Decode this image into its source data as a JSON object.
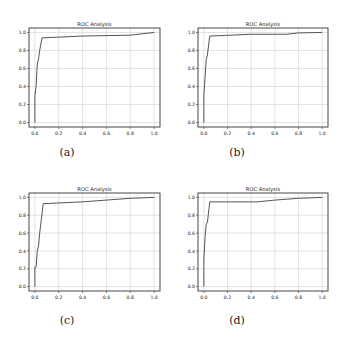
{
  "figure": {
    "captions": [
      "(a)",
      "(b)",
      "(c)",
      "(d)"
    ]
  },
  "chart_data": [
    {
      "type": "line",
      "panel": "a",
      "title": "ROC Analysis",
      "xlabel": "",
      "ylabel": "",
      "xlim": [
        0.0,
        1.0
      ],
      "ylim": [
        0.0,
        1.0
      ],
      "xticks": [
        "0.0",
        "0.2",
        "0.4",
        "0.6",
        "0.8",
        "1.0"
      ],
      "yticks": [
        "0.0",
        "0.2",
        "0.4",
        "0.6",
        "0.8",
        "1.0"
      ],
      "grid": true,
      "series": [
        {
          "name": "ROC",
          "x": [
            0.0,
            0.0,
            0.01,
            0.02,
            0.03,
            0.04,
            0.06,
            0.4,
            0.8,
            1.0
          ],
          "y": [
            0.0,
            0.3,
            0.4,
            0.65,
            0.7,
            0.8,
            0.94,
            0.96,
            0.97,
            1.0
          ]
        }
      ]
    },
    {
      "type": "line",
      "panel": "b",
      "title": "ROC Analysis",
      "xlabel": "",
      "ylabel": "",
      "xlim": [
        0.0,
        1.0
      ],
      "ylim": [
        0.0,
        1.0
      ],
      "xticks": [
        "0.0",
        "0.2",
        "0.4",
        "0.6",
        "0.8",
        "1.0"
      ],
      "yticks": [
        "0.0",
        "0.2",
        "0.4",
        "0.6",
        "0.8",
        "1.0"
      ],
      "grid": true,
      "series": [
        {
          "name": "ROC",
          "x": [
            0.0,
            0.0,
            0.01,
            0.02,
            0.03,
            0.05,
            0.4,
            0.7,
            0.8,
            1.0
          ],
          "y": [
            0.0,
            0.3,
            0.5,
            0.7,
            0.75,
            0.96,
            0.98,
            0.98,
            0.995,
            1.0
          ]
        }
      ]
    },
    {
      "type": "line",
      "panel": "c",
      "title": "ROC Analysis",
      "xlabel": "",
      "ylabel": "",
      "xlim": [
        0.0,
        1.0
      ],
      "ylim": [
        0.0,
        1.0
      ],
      "xticks": [
        "0.0",
        "0.2",
        "0.4",
        "0.6",
        "0.8",
        "1.0"
      ],
      "yticks": [
        "0.0",
        "0.2",
        "0.4",
        "0.6",
        "0.8",
        "1.0"
      ],
      "grid": true,
      "series": [
        {
          "name": "ROC",
          "x": [
            0.0,
            0.0,
            0.01,
            0.02,
            0.03,
            0.04,
            0.07,
            0.4,
            0.8,
            1.0
          ],
          "y": [
            0.0,
            0.22,
            0.22,
            0.4,
            0.45,
            0.6,
            0.93,
            0.95,
            0.99,
            1.0
          ]
        }
      ]
    },
    {
      "type": "line",
      "panel": "d",
      "title": "ROC Analysis",
      "xlabel": "",
      "ylabel": "",
      "xlim": [
        0.0,
        1.0
      ],
      "ylim": [
        0.0,
        1.0
      ],
      "xticks": [
        "0.0",
        "0.2",
        "0.4",
        "0.6",
        "0.8",
        "1.0"
      ],
      "yticks": [
        "0.0",
        "0.2",
        "0.4",
        "0.6",
        "0.8",
        "1.0"
      ],
      "grid": true,
      "series": [
        {
          "name": "ROC",
          "x": [
            0.0,
            0.0,
            0.01,
            0.02,
            0.03,
            0.05,
            0.45,
            0.6,
            0.8,
            1.0
          ],
          "y": [
            0.0,
            0.3,
            0.55,
            0.7,
            0.72,
            0.95,
            0.95,
            0.97,
            0.99,
            1.0
          ]
        }
      ]
    }
  ],
  "layout": {
    "panels": [
      {
        "left": 29,
        "top": 28,
        "w": 131,
        "h": 99,
        "cap_x": 62,
        "cap_y": 146
      },
      {
        "left": 198,
        "top": 28,
        "w": 130,
        "h": 99,
        "cap_x": 232,
        "cap_y": 146
      },
      {
        "left": 29,
        "top": 193,
        "w": 131,
        "h": 98,
        "cap_x": 62,
        "cap_y": 314
      },
      {
        "left": 198,
        "top": 193,
        "w": 130,
        "h": 98,
        "cap_x": 232,
        "cap_y": 314
      }
    ],
    "colors": {
      "line": "#555555",
      "grid": "#d0d0d0",
      "axes": "#333333",
      "text": "#222222"
    }
  }
}
